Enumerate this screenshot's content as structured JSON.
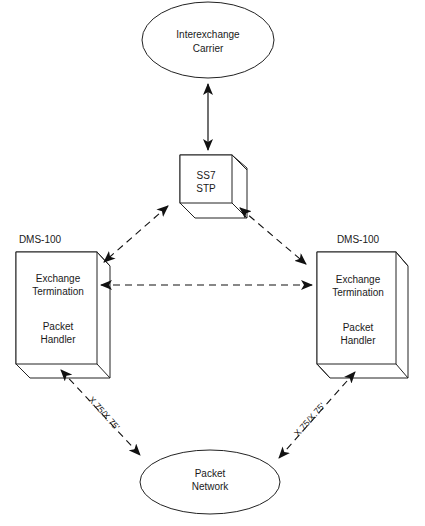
{
  "diagram": {
    "nodes": {
      "interexchange_carrier": {
        "line1": "Interexchange",
        "line2": "Carrier",
        "shape": "ellipse"
      },
      "ss7_stp": {
        "line1": "SS7",
        "line2": "STP",
        "shape": "cube"
      },
      "dms_left": {
        "title": "DMS-100",
        "line1": "Exchange",
        "line2": "Termination",
        "line3": "Packet",
        "line4": "Handler",
        "shape": "box3d"
      },
      "dms_right": {
        "title": "DMS-100",
        "line1": "Exchange",
        "line2": "Termination",
        "line3": "Packet",
        "line4": "Handler",
        "shape": "box3d"
      },
      "packet_network": {
        "line1": "Packet",
        "line2": "Network",
        "shape": "ellipse"
      }
    },
    "edges": [
      {
        "from": "interexchange_carrier",
        "to": "ss7_stp",
        "style": "solid",
        "direction": "both"
      },
      {
        "from": "ss7_stp",
        "to": "dms_left",
        "style": "dashed",
        "direction": "both"
      },
      {
        "from": "ss7_stp",
        "to": "dms_right",
        "style": "dashed",
        "direction": "both"
      },
      {
        "from": "dms_left",
        "to": "dms_right",
        "style": "dashed",
        "direction": "both"
      },
      {
        "from": "dms_left",
        "to": "packet_network",
        "style": "dashed",
        "direction": "both",
        "label": "X.75/X.75'"
      },
      {
        "from": "dms_right",
        "to": "packet_network",
        "style": "dashed",
        "direction": "both",
        "label": "X.75/X.75'"
      }
    ]
  }
}
